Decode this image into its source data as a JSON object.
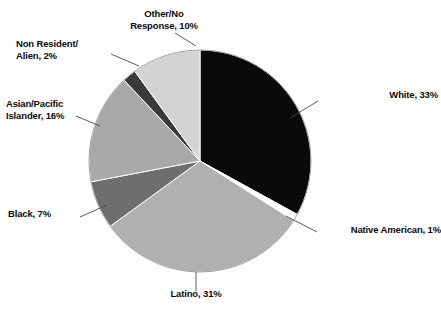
{
  "chart_data": {
    "type": "pie",
    "title": "",
    "subtitle": "",
    "legend_position": "callout-labels",
    "grid": false,
    "start_angle_deg": 0,
    "direction": "clockwise",
    "units": "percent",
    "categories": [
      "White",
      "Native American",
      "Latino",
      "Black",
      "Asian/Pacific Islander",
      "Non Resident/Alien",
      "Other/No Response"
    ],
    "values": [
      33,
      1,
      31,
      7,
      16,
      2,
      10
    ],
    "colors": [
      "#0a0a0a",
      "#fdfdfd",
      "#b0b0b0",
      "#6e6e6e",
      "#a8a8a8",
      "#3a3a3a",
      "#d3d3d3"
    ],
    "slices": [
      {
        "label": "White",
        "value": 33,
        "color": "#0a0a0a"
      },
      {
        "label": "Native American",
        "value": 1,
        "color": "#fdfdfd"
      },
      {
        "label": "Latino",
        "value": 31,
        "color": "#b0b0b0"
      },
      {
        "label": "Black",
        "value": 7,
        "color": "#6e6e6e"
      },
      {
        "label": "Asian/Pacific Islander",
        "value": 16,
        "color": "#a8a8a8"
      },
      {
        "label": "Non Resident/Alien",
        "value": 2,
        "color": "#3a3a3a"
      },
      {
        "label": "Other/No Response",
        "value": 10,
        "color": "#d3d3d3"
      }
    ]
  },
  "labels": {
    "white": "White, 33%",
    "native_american": "Native American, 1%",
    "latino": "Latino, 31%",
    "black": "Black, 7%",
    "asian_pacific_islander": "Asian/Pacific\nIslander, 16%",
    "non_resident_alien": "Non Resident/\nAlien, 2%",
    "other_no_response": "Other/No\nResponse, 10%"
  },
  "style": {
    "background": "#ffffff",
    "text_color": "#0b0b0b",
    "leader_line_color": "#4a4a4a"
  }
}
